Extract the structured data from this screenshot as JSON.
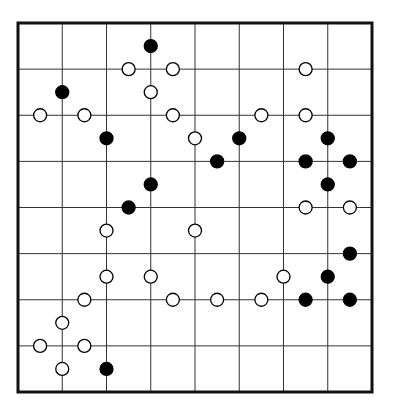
{
  "puzzle": {
    "type": "masyu-style dot grid",
    "columns": 8,
    "rows": 8,
    "grid": {
      "left": 18,
      "top": 23,
      "right": 372,
      "bottom": 392
    },
    "colors": {
      "line": "#333333",
      "border": "#111111",
      "black": "#000000",
      "white": "#ffffff"
    },
    "coordinate_note": "circle positions in half-cell units from top-left corner (x_half, y_half)",
    "circles": [
      {
        "x": 6,
        "y": 1,
        "color": "black"
      },
      {
        "x": 5,
        "y": 2,
        "color": "white"
      },
      {
        "x": 7,
        "y": 2,
        "color": "white"
      },
      {
        "x": 13,
        "y": 2,
        "color": "white"
      },
      {
        "x": 2,
        "y": 3,
        "color": "black"
      },
      {
        "x": 6,
        "y": 3,
        "color": "white"
      },
      {
        "x": 1,
        "y": 4,
        "color": "white"
      },
      {
        "x": 3,
        "y": 4,
        "color": "white"
      },
      {
        "x": 7,
        "y": 4,
        "color": "white"
      },
      {
        "x": 11,
        "y": 4,
        "color": "white"
      },
      {
        "x": 13,
        "y": 4,
        "color": "white"
      },
      {
        "x": 4,
        "y": 5,
        "color": "black"
      },
      {
        "x": 8,
        "y": 5,
        "color": "white"
      },
      {
        "x": 10,
        "y": 5,
        "color": "black"
      },
      {
        "x": 14,
        "y": 5,
        "color": "black"
      },
      {
        "x": 9,
        "y": 6,
        "color": "black"
      },
      {
        "x": 13,
        "y": 6,
        "color": "black"
      },
      {
        "x": 15,
        "y": 6,
        "color": "black"
      },
      {
        "x": 6,
        "y": 7,
        "color": "black"
      },
      {
        "x": 14,
        "y": 7,
        "color": "black"
      },
      {
        "x": 5,
        "y": 8,
        "color": "black"
      },
      {
        "x": 13,
        "y": 8,
        "color": "white"
      },
      {
        "x": 15,
        "y": 8,
        "color": "white"
      },
      {
        "x": 4,
        "y": 9,
        "color": "white"
      },
      {
        "x": 8,
        "y": 9,
        "color": "white"
      },
      {
        "x": 15,
        "y": 10,
        "color": "black"
      },
      {
        "x": 4,
        "y": 11,
        "color": "white"
      },
      {
        "x": 6,
        "y": 11,
        "color": "white"
      },
      {
        "x": 12,
        "y": 11,
        "color": "white"
      },
      {
        "x": 14,
        "y": 11,
        "color": "black"
      },
      {
        "x": 3,
        "y": 12,
        "color": "white"
      },
      {
        "x": 7,
        "y": 12,
        "color": "white"
      },
      {
        "x": 9,
        "y": 12,
        "color": "white"
      },
      {
        "x": 11,
        "y": 12,
        "color": "white"
      },
      {
        "x": 13,
        "y": 12,
        "color": "black"
      },
      {
        "x": 15,
        "y": 12,
        "color": "black"
      },
      {
        "x": 2,
        "y": 13,
        "color": "white"
      },
      {
        "x": 1,
        "y": 14,
        "color": "white"
      },
      {
        "x": 3,
        "y": 14,
        "color": "white"
      },
      {
        "x": 2,
        "y": 15,
        "color": "white"
      },
      {
        "x": 4,
        "y": 15,
        "color": "black"
      }
    ]
  }
}
